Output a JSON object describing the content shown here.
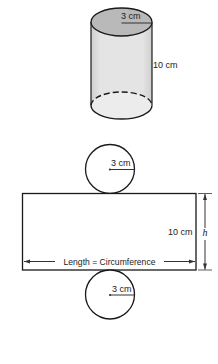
{
  "cylinder": {
    "radius_label": "3 cm",
    "height_label": "10 cm",
    "colors": {
      "top": "#b9b9b9",
      "body": "#e2e2e2",
      "bottom": "#ececec",
      "stroke": "#1a1a1a"
    }
  },
  "net": {
    "top_circle": {
      "radius_label": "3 cm"
    },
    "rectangle": {
      "height_label": "10 cm",
      "height_symbol": "h",
      "length_label": "Length = Circumference"
    },
    "bottom_circle": {
      "radius_label": "3 cm"
    }
  }
}
